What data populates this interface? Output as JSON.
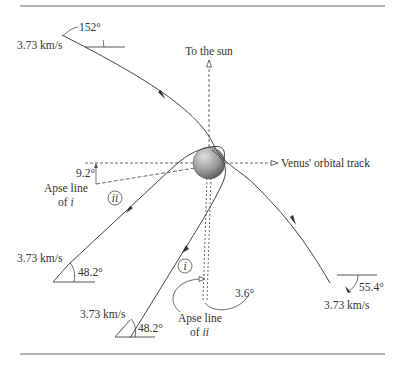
{
  "diagram": {
    "title_rules": true,
    "labels": {
      "sun": "To the sun",
      "venus_track": "Venus' orbital track",
      "apse_i_line1": "Apse line",
      "apse_i_line2_prefix": "of ",
      "apse_i_line2_var": "i",
      "apse_ii_line1": "Apse line",
      "apse_ii_line2_prefix": "of ",
      "apse_ii_line2_var": "ii",
      "traj_i": "i",
      "traj_ii": "ii"
    },
    "speeds": {
      "top_left": "3.73 km/s",
      "mid_left": "3.73 km/s",
      "bottom_left": "3.73 km/s",
      "bottom_right": "3.73 km/s"
    },
    "angles": {
      "top": "152°",
      "apse_i": "9.2°",
      "mid_left": "48.2°",
      "bottom_left": "48.2°",
      "apse_ii": "3.6°",
      "bottom_right": "55.4°"
    },
    "colors": {
      "line": "#444444",
      "rule": "#666666",
      "planet_light": "#d8d8d8",
      "planet_dark": "#6a6a6a"
    }
  }
}
